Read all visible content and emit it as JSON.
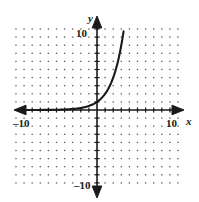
{
  "figure": {
    "name": "exponential-function-graph",
    "background_color": "#ffffff",
    "ink_color": "#1a1a1a",
    "grid_dot_color": "#555555"
  },
  "axes": {
    "x_axis_label": "x",
    "y_axis_label": "y",
    "x_tick_left_label": "–10",
    "x_tick_right_label": "10",
    "y_tick_top_label": "10",
    "y_tick_bottom_label": "–10",
    "origin_px": {
      "x": 97,
      "y": 110
    },
    "unit_px": 8.1,
    "x_range": [
      -10,
      10
    ],
    "y_range": [
      -10,
      10
    ],
    "tick_interval": 1,
    "arrowheads": [
      "left",
      "right",
      "up",
      "down"
    ]
  },
  "chart_data": {
    "type": "line",
    "title": "",
    "xlabel": "x",
    "ylabel": "y",
    "xlim": [
      -10,
      10
    ],
    "ylim": [
      -10,
      10
    ],
    "grid": "dotted-lattice",
    "legend": "none",
    "series": [
      {
        "name": "exponential-curve",
        "equation": "y = 2^x",
        "color": "#1a1a1a",
        "x": [
          -10,
          -9,
          -8,
          -7,
          -6,
          -5,
          -4,
          -3,
          -2,
          -1,
          0,
          1,
          2,
          3,
          3.3
        ],
        "y": [
          0.001,
          0.002,
          0.004,
          0.008,
          0.016,
          0.031,
          0.063,
          0.125,
          0.25,
          0.5,
          1,
          2,
          4,
          8,
          9.9
        ]
      }
    ],
    "annotations": []
  }
}
